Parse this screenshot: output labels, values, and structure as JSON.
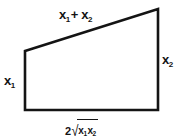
{
  "diagram": {
    "type": "geometric-figure",
    "shape": "right-trapezoid",
    "background_color": "#ffffff",
    "stroke_color": "#141414",
    "stroke_width": 2.6,
    "vertices": {
      "top_left": [
        25,
        51
      ],
      "top_right": [
        158,
        9
      ],
      "bottom_right": [
        158,
        110
      ],
      "bottom_left": [
        25,
        110
      ]
    },
    "labels": {
      "top": {
        "text": "x1+ x2",
        "var": "x",
        "sub_first": "1",
        "operator": "+",
        "var_second": "x",
        "sub_second": "2",
        "position": "above-slanted-top-edge"
      },
      "left": {
        "text": "x1",
        "var": "x",
        "sub": "1",
        "position": "left-of-vertical-left-edge"
      },
      "right": {
        "text": "x2",
        "var": "x",
        "sub": "2",
        "position": "right-of-vertical-right-edge"
      },
      "bottom": {
        "text": "2√x1x2",
        "coefficient": "2",
        "radical_sign": "√",
        "radicand_var_first": "x",
        "radicand_sub_first": "1",
        "radicand_var_second": "x",
        "radicand_sub_second": "2",
        "position": "below-bottom-edge"
      }
    }
  }
}
